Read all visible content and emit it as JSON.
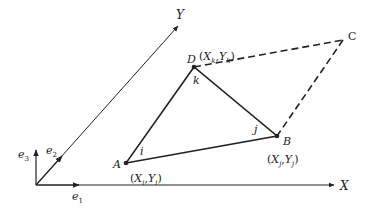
{
  "diagram": {
    "axes": {
      "x_label": "X",
      "y_label": "Y",
      "basis": [
        "e",
        "e",
        "e"
      ],
      "basis_subscripts": [
        "1",
        "2",
        "3"
      ]
    },
    "points": {
      "A": {
        "name": "A",
        "local": "i",
        "coord_x": "X",
        "coord_x_sub": "i",
        "coord_y": "Y",
        "coord_y_sub": "i"
      },
      "B": {
        "name": "B",
        "local": "j",
        "coord_x": "X",
        "coord_x_sub": "j",
        "coord_y": "Y",
        "coord_y_sub": "j"
      },
      "D": {
        "name": "D",
        "local": "k",
        "coord_x": "X",
        "coord_x_sub": "k",
        "coord_y": "Y",
        "coord_y_sub": "k"
      },
      "C": {
        "name": "C"
      }
    },
    "punct": {
      "open": "(",
      "comma": ",",
      "close": ")"
    },
    "colors": {
      "stroke": "#222222",
      "background": "#ffffff"
    }
  }
}
